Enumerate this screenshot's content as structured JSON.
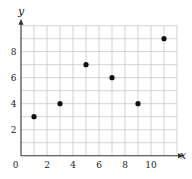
{
  "chart_data": {
    "type": "scatter",
    "title": "",
    "xlabel": "x",
    "ylabel": "y",
    "xlim": [
      0,
      12
    ],
    "ylim": [
      0,
      10
    ],
    "grid": true,
    "x_ticks": [
      0,
      2,
      4,
      6,
      8,
      10
    ],
    "y_ticks": [
      2,
      4,
      6,
      8
    ],
    "x_tick_labels": [
      "0",
      "2",
      "4",
      "6",
      "8",
      "10"
    ],
    "y_tick_labels": [
      "2",
      "4",
      "6",
      "8"
    ],
    "legend": null,
    "series": [
      {
        "name": "points",
        "x": [
          1,
          3,
          5,
          7,
          9,
          11
        ],
        "y": [
          3,
          4,
          7,
          6,
          4,
          9
        ]
      }
    ]
  },
  "style": {
    "grid_color": "#c8c8c8",
    "axis_color": "#333333",
    "point_color": "#111111"
  }
}
